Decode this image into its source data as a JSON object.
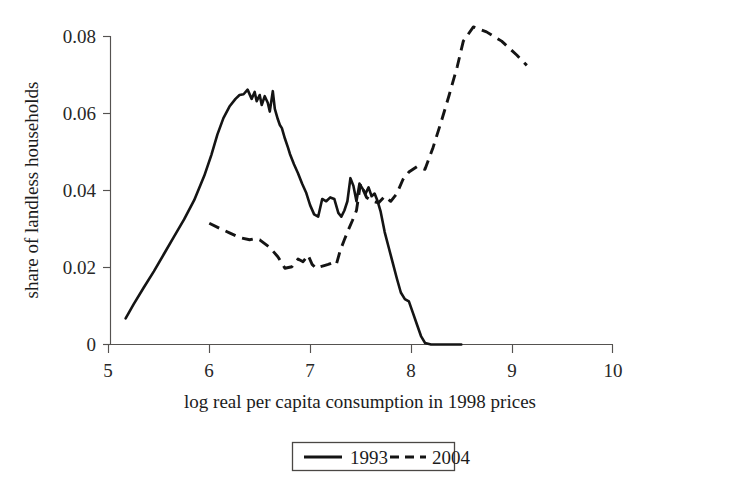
{
  "chart_data": {
    "type": "line",
    "title": "",
    "subtitle": "",
    "xlabel": "log real per capita consumption in 1998 prices",
    "ylabel": "share of landless households",
    "xlim": [
      5,
      10
    ],
    "ylim": [
      0,
      0.085
    ],
    "grid": false,
    "legend_position": "bottom-center",
    "xticks": [
      "5",
      "6",
      "7",
      "8",
      "9",
      "10"
    ],
    "xtick_values": [
      5,
      6,
      7,
      8,
      9,
      10
    ],
    "yticks": [
      "0",
      "0.02",
      "0.04",
      "0.06",
      "0.08"
    ],
    "ytick_values": [
      0,
      0.02,
      0.04,
      0.06,
      0.08
    ],
    "series": [
      {
        "name": "1993",
        "style": "solid",
        "color": "#141414",
        "x": [
          5.17,
          5.25,
          5.35,
          5.45,
          5.55,
          5.65,
          5.75,
          5.85,
          5.95,
          6.02,
          6.08,
          6.14,
          6.2,
          6.26,
          6.3,
          6.34,
          6.38,
          6.42,
          6.45,
          6.47,
          6.5,
          6.52,
          6.55,
          6.58,
          6.6,
          6.63,
          6.65,
          6.68,
          6.7,
          6.72,
          6.75,
          6.78,
          6.8,
          6.84,
          6.88,
          6.92,
          6.96,
          7.0,
          7.04,
          7.08,
          7.12,
          7.16,
          7.2,
          7.24,
          7.28,
          7.31,
          7.34,
          7.37,
          7.4,
          7.43,
          7.46,
          7.49,
          7.52,
          7.55,
          7.58,
          7.61,
          7.64,
          7.67,
          7.7,
          7.74,
          7.78,
          7.82,
          7.86,
          7.9,
          7.94,
          7.98,
          8.02,
          8.06,
          8.1,
          8.14,
          8.2,
          8.3,
          8.4,
          8.5
        ],
        "y": [
          0.0068,
          0.0105,
          0.0148,
          0.019,
          0.0235,
          0.028,
          0.0325,
          0.0375,
          0.0438,
          0.0492,
          0.0545,
          0.0588,
          0.0618,
          0.0638,
          0.0648,
          0.065,
          0.0662,
          0.0638,
          0.0656,
          0.0632,
          0.0648,
          0.0622,
          0.0645,
          0.0628,
          0.0605,
          0.0658,
          0.0612,
          0.0585,
          0.057,
          0.0562,
          0.0535,
          0.0512,
          0.0495,
          0.0468,
          0.0445,
          0.0418,
          0.0395,
          0.0362,
          0.0338,
          0.0332,
          0.0378,
          0.0372,
          0.0382,
          0.0378,
          0.0342,
          0.0332,
          0.0348,
          0.0372,
          0.0432,
          0.0412,
          0.0372,
          0.0418,
          0.0405,
          0.0392,
          0.0408,
          0.0385,
          0.0392,
          0.0372,
          0.0345,
          0.0292,
          0.0252,
          0.0212,
          0.0172,
          0.0135,
          0.0118,
          0.0112,
          0.0082,
          0.0052,
          0.0022,
          0.0004,
          0.0,
          0.0,
          0.0,
          0.0
        ]
      },
      {
        "name": "2004",
        "style": "dashed",
        "color": "#141414",
        "x": [
          6.0,
          6.1,
          6.2,
          6.3,
          6.4,
          6.45,
          6.5,
          6.6,
          6.68,
          6.75,
          6.82,
          6.88,
          6.93,
          6.98,
          7.02,
          7.06,
          7.1,
          7.14,
          7.18,
          7.22,
          7.26,
          7.3,
          7.34,
          7.38,
          7.42,
          7.46,
          7.5,
          7.56,
          7.62,
          7.68,
          7.74,
          7.8,
          7.86,
          7.92,
          7.98,
          8.06,
          8.14,
          8.22,
          8.3,
          8.38,
          8.46,
          8.52,
          8.62,
          8.75,
          8.9,
          9.05,
          9.15
        ],
        "y": [
          0.0315,
          0.0302,
          0.029,
          0.0278,
          0.0272,
          0.0275,
          0.0272,
          0.0252,
          0.0228,
          0.0198,
          0.0202,
          0.0222,
          0.0215,
          0.0232,
          0.0208,
          0.0198,
          0.0202,
          0.0205,
          0.0208,
          0.0212,
          0.0208,
          0.0245,
          0.0272,
          0.0298,
          0.0322,
          0.0348,
          0.0418,
          0.0382,
          0.0372,
          0.0368,
          0.0385,
          0.0372,
          0.0392,
          0.0428,
          0.0448,
          0.0462,
          0.0455,
          0.0512,
          0.0578,
          0.0648,
          0.0722,
          0.0788,
          0.0825,
          0.0812,
          0.0788,
          0.0752,
          0.0725
        ]
      }
    ],
    "legend_entries": [
      {
        "label": "1993",
        "style": "solid"
      },
      {
        "label": "2004",
        "style": "dashed"
      }
    ]
  }
}
